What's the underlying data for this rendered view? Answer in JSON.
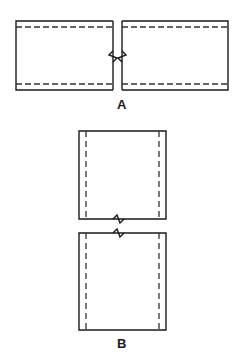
{
  "figure": {
    "background_color": "#ffffff",
    "line_color": "#1a1a1a",
    "dash_color": "#333333",
    "width": 244,
    "height": 359,
    "type": "engineering-line-drawing"
  },
  "views": [
    {
      "id": "view-a",
      "label": "A",
      "label_position": {
        "x": 107,
        "y": 98
      },
      "orientation": "horizontal",
      "break_type": "vertical-break-with-zigzag",
      "break_gap": {
        "x_start": 113,
        "x_end": 122
      },
      "parts": [
        {
          "id": "a-left-rect",
          "rect": {
            "x": 16,
            "y": 21,
            "width": 97,
            "height": 69
          },
          "open_side": "right",
          "dashed_lines": [
            {
              "orientation": "horizontal",
              "offset_from_top": 6
            },
            {
              "orientation": "horizontal",
              "offset_from_bottom": 6
            }
          ]
        },
        {
          "id": "a-right-rect",
          "rect": {
            "x": 122,
            "y": 21,
            "width": 106,
            "height": 69
          },
          "open_side": "left",
          "dashed_lines": [
            {
              "orientation": "horizontal",
              "offset_from_top": 6
            },
            {
              "orientation": "horizontal",
              "offset_from_bottom": 6
            }
          ]
        }
      ]
    },
    {
      "id": "view-b",
      "label": "B",
      "label_position": {
        "x": 107,
        "y": 337
      },
      "orientation": "vertical",
      "break_type": "horizontal-break-with-zigzag",
      "break_gap": {
        "y_start": 219,
        "y_end": 233
      },
      "parts": [
        {
          "id": "b-top-rect",
          "rect": {
            "x": 79,
            "y": 131,
            "width": 87,
            "height": 88
          },
          "open_side": "none",
          "dashed_lines": [
            {
              "orientation": "vertical",
              "offset_from_left": 7
            },
            {
              "orientation": "vertical",
              "offset_from_right": 7
            }
          ]
        },
        {
          "id": "b-bottom-rect",
          "rect": {
            "x": 79,
            "y": 233,
            "width": 87,
            "height": 97
          },
          "open_side": "none",
          "dashed_lines": [
            {
              "orientation": "vertical",
              "offset_from_left": 7
            },
            {
              "orientation": "vertical",
              "offset_from_right": 7
            }
          ]
        }
      ]
    }
  ]
}
